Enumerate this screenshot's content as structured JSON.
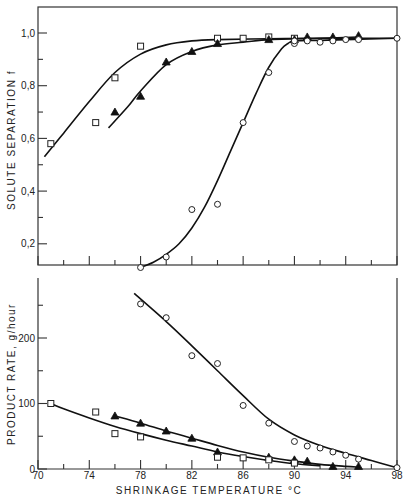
{
  "chart_data": [
    {
      "type": "scatter",
      "panel": "top",
      "title": "",
      "xlabel": "",
      "ylabel": "SOLUTE SEPARATION f",
      "xlim": [
        70,
        98
      ],
      "ylim": [
        0.12,
        1.1
      ],
      "yticks": [
        0.2,
        0.4,
        0.6,
        0.8,
        1.0
      ],
      "ytick_labels": [
        "0,2",
        "0,4",
        "0,6",
        "0,8",
        "1,0"
      ],
      "yminor_ticks": [
        0.3,
        0.5,
        0.7,
        0.9
      ],
      "grid": false,
      "series": [
        {
          "name": "square",
          "marker": "open-square",
          "x": [
            71,
            74.5,
            76,
            78,
            84,
            86,
            88,
            90
          ],
          "y": [
            0.58,
            0.66,
            0.83,
            0.95,
            0.98,
            0.98,
            0.985,
            0.98
          ],
          "curve_x": [
            70.5,
            72,
            74,
            76,
            78,
            80,
            82,
            84,
            88,
            92,
            98
          ],
          "curve_y": [
            0.53,
            0.62,
            0.74,
            0.85,
            0.92,
            0.955,
            0.97,
            0.975,
            0.978,
            0.98,
            0.98
          ]
        },
        {
          "name": "triangle",
          "marker": "filled-triangle",
          "x": [
            76,
            78,
            80,
            82,
            84,
            88,
            90,
            91,
            93,
            95
          ],
          "y": [
            0.7,
            0.76,
            0.89,
            0.93,
            0.96,
            0.975,
            0.975,
            0.985,
            0.985,
            0.99
          ],
          "curve_x": [
            75.5,
            77,
            78,
            80,
            82,
            84,
            86,
            88,
            90,
            92,
            95
          ],
          "curve_y": [
            0.64,
            0.72,
            0.78,
            0.88,
            0.93,
            0.955,
            0.965,
            0.975,
            0.978,
            0.98,
            0.985
          ]
        },
        {
          "name": "circle",
          "marker": "open-circle",
          "x": [
            78,
            80,
            82,
            84,
            86,
            88,
            90,
            90,
            91,
            92,
            93,
            94,
            95,
            98
          ],
          "y": [
            0.11,
            0.15,
            0.33,
            0.35,
            0.66,
            0.85,
            0.96,
            0.97,
            0.97,
            0.965,
            0.97,
            0.975,
            0.975,
            0.98
          ],
          "curve_x": [
            78,
            79,
            80,
            81,
            82,
            83,
            84,
            85,
            86,
            87,
            88,
            89,
            89.5,
            90,
            92,
            94,
            98
          ],
          "curve_y": [
            0.11,
            0.13,
            0.16,
            0.2,
            0.26,
            0.34,
            0.44,
            0.55,
            0.66,
            0.77,
            0.87,
            0.94,
            0.96,
            0.97,
            0.972,
            0.975,
            0.98
          ]
        }
      ]
    },
    {
      "type": "scatter",
      "panel": "bottom",
      "title": "",
      "xlabel": "SHRINKAGE TEMPERATURE °C",
      "ylabel": "PRODUCT RATE, g/hour",
      "xlim": [
        70,
        98
      ],
      "ylim": [
        0,
        290
      ],
      "xticks": [
        70,
        74,
        78,
        82,
        86,
        90,
        94,
        98
      ],
      "xtick_labels": [
        "70",
        "74",
        "78",
        "82",
        "86",
        "90",
        "94",
        "98"
      ],
      "xminor_ticks": [
        72,
        76,
        80,
        84,
        88,
        92,
        96
      ],
      "yticks": [
        0,
        100,
        200
      ],
      "ytick_labels": [
        "0",
        "100",
        "200"
      ],
      "yminor_ticks": [
        50,
        150,
        250
      ],
      "grid": false,
      "series": [
        {
          "name": "circle",
          "marker": "open-circle",
          "x": [
            78,
            80,
            82,
            84,
            86,
            88,
            90,
            91,
            92,
            93,
            94,
            95,
            98
          ],
          "y": [
            252,
            231,
            173,
            161,
            97,
            70,
            42,
            35,
            32,
            26,
            21,
            15,
            2
          ],
          "curve_x": [
            77.5,
            80,
            82,
            84,
            86,
            88,
            90,
            92,
            94,
            96,
            98
          ],
          "curve_y": [
            268,
            225,
            188,
            150,
            112,
            76,
            52,
            36,
            24,
            13,
            2
          ]
        },
        {
          "name": "triangle",
          "marker": "filled-triangle",
          "x": [
            76,
            78,
            80,
            82,
            84,
            88,
            90,
            91,
            93,
            95
          ],
          "y": [
            81,
            70,
            58,
            47,
            26,
            18,
            14,
            12,
            4,
            4
          ],
          "curve_x": [
            76,
            78,
            80,
            82,
            84,
            86,
            88,
            90,
            92,
            94,
            95
          ],
          "curve_y": [
            81,
            70,
            58,
            47,
            36,
            26,
            18,
            12,
            7,
            4,
            3
          ]
        },
        {
          "name": "square",
          "marker": "open-square",
          "x": [
            71,
            74.5,
            76,
            78,
            84,
            86,
            88,
            90
          ],
          "y": [
            100,
            87,
            54,
            49,
            18,
            17,
            14,
            9
          ],
          "curve_x": [
            71,
            72,
            74,
            76,
            78,
            80,
            82,
            84,
            86,
            88,
            90,
            92
          ],
          "curve_y": [
            100,
            92,
            78,
            65,
            54,
            44,
            35,
            26,
            19,
            13,
            8,
            5
          ]
        }
      ]
    }
  ],
  "labels": {
    "top_ylabel": "SOLUTE SEPARATION f",
    "bottom_ylabel": "PRODUCT RATE, g/hour",
    "xlabel": "SHRINKAGE TEMPERATURE °C"
  }
}
